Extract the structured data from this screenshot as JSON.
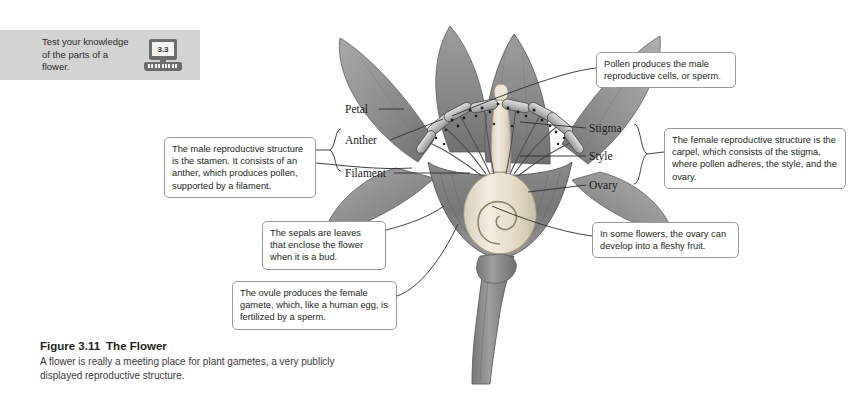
{
  "banner": {
    "prompt": "Test your knowledge of the parts of a flower.",
    "icon": "computer-icon",
    "section_number": "3.3",
    "background": "#d3d3d3"
  },
  "callouts": [
    {
      "id": "pollen",
      "text": "Pollen produces the male reproductive cells, or sperm."
    },
    {
      "id": "carpel",
      "text": "The female reproductive structure is the carpel, which consists of the stigma, where pollen adheres, the style, and the ovary."
    },
    {
      "id": "stamen",
      "text": "The male reproductive structure is the stamen. It consists of an anther, which produces pollen, supported by a filament."
    },
    {
      "id": "sepals",
      "text": "The sepals are leaves that enclose the flower when it is a bud."
    },
    {
      "id": "fruit",
      "text": "In some flowers, the ovary can develop into a fleshy fruit."
    },
    {
      "id": "ovule",
      "text": "The ovule produces the female gamete, which, like a human egg, is fertilized by a sperm."
    }
  ],
  "anatomy_labels": {
    "petal": "Petal",
    "anther": "Anther",
    "filament": "Filament",
    "stigma": "Stigma",
    "style": "Style",
    "ovary": "Ovary"
  },
  "caption": {
    "figure_number": "Figure 3.11",
    "title": "The Flower",
    "body": "A flower is really a meeting place for plant gametes, a very publicly displayed reproductive structure."
  },
  "colors": {
    "banner_gray": "#d3d3d3",
    "callout_border": "#9a9a9a",
    "petal_gray": "#8d8d8d",
    "carpel_cream": "#e9e2d2",
    "stem_gray": "#8a8a8a",
    "text": "#231f20"
  }
}
